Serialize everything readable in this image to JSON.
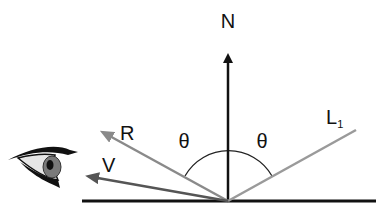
{
  "diagram": {
    "labels": {
      "normal": "N",
      "reflected": "R",
      "view": "V",
      "light": "L",
      "light_subscript": "1",
      "angle_left": "θ",
      "angle_right": "θ"
    },
    "colors": {
      "normal": "#111111",
      "surface": "#111111",
      "reflected": "#8a8a8a",
      "light": "#9a9a9a",
      "view": "#555555",
      "arc": "#222222"
    }
  }
}
